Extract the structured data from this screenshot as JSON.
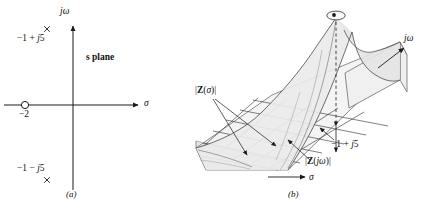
{
  "figure": {
    "background_color": "#ffffff",
    "line_color": "#1a1a1a",
    "surface_fill": "#e8e8e8",
    "surface_fill_light": "#f2f2f2",
    "base_fill": "#ededed"
  },
  "panel_a": {
    "caption": "(a)",
    "plane_label": "s plane",
    "axis_vertical_label": "jω",
    "axis_horizontal_label": "σ",
    "pole_upper_label": "−1 + j5",
    "pole_lower_label": "−1 − j5",
    "zero_label": "−2",
    "pole_marker_glyph": "×",
    "zero_marker_glyph": "○",
    "poles": [
      {
        "name": "pole-upper",
        "real": -1,
        "imag": 5
      },
      {
        "name": "pole-lower",
        "real": -1,
        "imag": -5
      }
    ],
    "zeros": [
      {
        "name": "zero-left",
        "real": -2,
        "imag": 0
      }
    ]
  },
  "panel_b": {
    "caption": "(b)",
    "axis_jw_label": "jω",
    "axis_sigma_label": "σ",
    "surface_sigma_label": "|Z(σ)|",
    "surface_jw_label": "|Z(jω)|",
    "pole_label": "−1 + j5",
    "peak_marker_glyph": "•",
    "description": "Three-dimensional plot of |Z(s)| over the s plane showing a pole spike at s = −1 + j5"
  },
  "chart_data": {
    "type": "scatter",
    "title": "s plane",
    "xlabel": "σ",
    "ylabel": "jω",
    "xlim": [
      -4,
      4
    ],
    "ylim": [
      -8,
      8
    ],
    "grid": false,
    "legend": "none",
    "series": [
      {
        "name": "poles",
        "marker": "x",
        "x": [
          -1,
          -1
        ],
        "y": [
          5,
          -5
        ],
        "labels": [
          "−1 + j5",
          "−1 − j5"
        ]
      },
      {
        "name": "zeros",
        "marker": "o",
        "x": [
          -2
        ],
        "y": [
          0
        ],
        "labels": [
          "−2"
        ]
      }
    ],
    "annotations": [
      {
        "text": "s plane",
        "x": 1.2,
        "y": 3.2
      },
      {
        "text": "(a)",
        "x": 0.0,
        "y": -7.6
      }
    ]
  }
}
